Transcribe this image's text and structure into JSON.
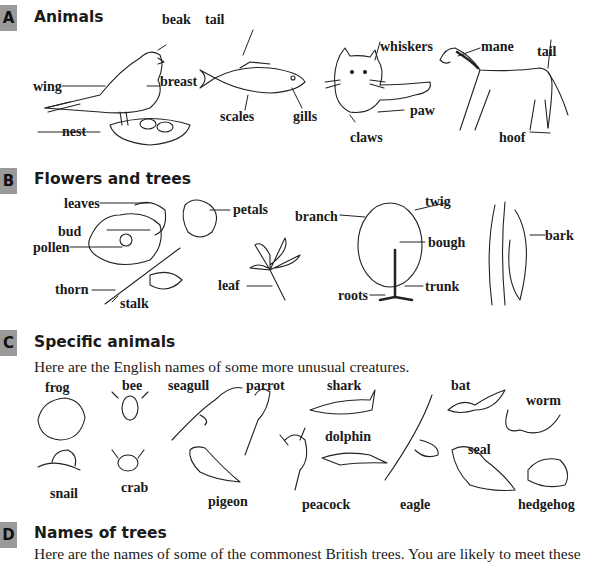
{
  "sections": [
    {
      "letter": "A",
      "title": "Animals",
      "labels": {
        "beak": "beak",
        "tail_fish": "tail",
        "wing": "wing",
        "breast": "breast",
        "nest": "nest",
        "scales": "scales",
        "gills": "gills",
        "whiskers": "whiskers",
        "paw": "paw",
        "claws": "claws",
        "mane": "mane",
        "tail_horse": "tail",
        "hoof": "hoof"
      }
    },
    {
      "letter": "B",
      "title": "Flowers and trees",
      "labels": {
        "leaves": "leaves",
        "petals": "petals",
        "bud": "bud",
        "pollen": "pollen",
        "thorn": "thorn",
        "stalk": "stalk",
        "leaf": "leaf",
        "branch": "branch",
        "twig": "twig",
        "bough": "bough",
        "trunk": "trunk",
        "roots": "roots",
        "bark": "bark"
      }
    },
    {
      "letter": "C",
      "title": "Specific animals",
      "intro": "Here are the English names of some more unusual creatures.",
      "labels": {
        "frog": "frog",
        "bee": "bee",
        "seagull": "seagull",
        "parrot": "parrot",
        "shark": "shark",
        "bat": "bat",
        "worm": "worm",
        "dolphin": "dolphin",
        "seal": "seal",
        "snail": "snail",
        "crab": "crab",
        "pigeon": "pigeon",
        "peacock": "peacock",
        "eagle": "eagle",
        "hedgehog": "hedgehog"
      }
    },
    {
      "letter": "D",
      "title": "Names of trees",
      "intro": "Here are the names of some of the commonest British trees. You are likely to meet these"
    }
  ]
}
